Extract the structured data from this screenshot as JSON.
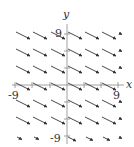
{
  "figure": {
    "type": "direction-field",
    "axes": {
      "x_label": "x",
      "y_label": "y",
      "x_min_label": "-9",
      "x_max_label": "9",
      "y_min_label": "-9",
      "y_max_label": "9",
      "range": [
        -9,
        9
      ],
      "tick_step": 3
    },
    "field": {
      "slope": -0.5,
      "grid_x": [
        -9,
        -6,
        -3,
        0,
        3,
        6,
        9
      ],
      "grid_y": [
        -9,
        -6,
        -3,
        0,
        3,
        6,
        9
      ],
      "arrow_color": "#333333"
    },
    "colors": {
      "axis": "#888888",
      "arrow": "#333333",
      "background": "#ffffff"
    }
  }
}
